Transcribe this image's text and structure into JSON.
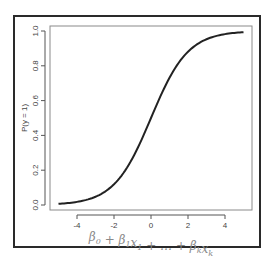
{
  "chart_data": {
    "type": "line",
    "title": "",
    "xlabel": "β0 + β1x1 + … + βkxk",
    "ylabel": "P(y = 1)",
    "xlim": [
      -5,
      5
    ],
    "ylim": [
      0,
      1
    ],
    "x_ticks": [
      -4,
      -2,
      0,
      2,
      4
    ],
    "x_tick_labels": [
      "-4",
      "-2",
      "0",
      "2",
      "4"
    ],
    "y_ticks": [
      0.0,
      0.2,
      0.4,
      0.6,
      0.8,
      1.0
    ],
    "y_tick_labels": [
      "0.0",
      "0.2",
      "0.4",
      "0.6",
      "0.8",
      "1.0"
    ],
    "grid": false,
    "legend": null,
    "series": [
      {
        "name": "logistic",
        "function": "1/(1+exp(-x))",
        "x": [
          -5,
          -4,
          -3,
          -2,
          -1,
          0,
          1,
          2,
          3,
          4,
          5
        ],
        "values": [
          0.007,
          0.018,
          0.047,
          0.119,
          0.269,
          0.5,
          0.731,
          0.881,
          0.953,
          0.982,
          0.993
        ]
      }
    ]
  },
  "colors": {
    "curve": "#222222",
    "frame": "#2a2a2a",
    "plot_box": "#8a8a8a",
    "label": "#444444"
  }
}
